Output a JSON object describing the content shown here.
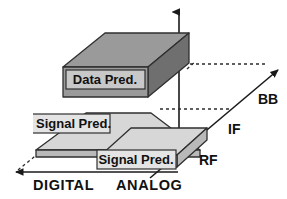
{
  "diagram": {
    "type": "3d-layered-block-diagram",
    "colors": {
      "top_face_dark": "#9a9a9a",
      "side_face_dark": "#6f6f6f",
      "top_face_light": "#d7d7d7",
      "side_face_light": "#b9b9b9",
      "label_box_fill": "#c8c8c8",
      "label_box_fill_light": "#e4e4e4",
      "outline": "#2f2f2f",
      "axis": "#1a1a1a",
      "background": "#ffffff"
    },
    "slabs": [
      {
        "id": "top",
        "label": "Data Pred.",
        "level": "BB",
        "clipped": false
      },
      {
        "id": "middle",
        "label": "Signal Pred.",
        "level": "IF",
        "clipped": true
      },
      {
        "id": "bottom",
        "label": "Signal Pred.",
        "level": "RF",
        "clipped": false
      }
    ],
    "axes": {
      "vertical": {
        "name": "vertical-axis",
        "arrow": "up"
      },
      "horizontal": {
        "name": "horizontal-axis",
        "arrow": "left",
        "ticks": [
          "DIGITAL",
          "ANALOG"
        ]
      },
      "depth": {
        "name": "depth-axis",
        "arrow": "up-right",
        "ticks": [
          "RF",
          "IF",
          "BB"
        ]
      }
    },
    "labels": {
      "digital": "DIGITAL",
      "analog": "ANALOG",
      "rf": "RF",
      "if": "IF",
      "bb": "BB",
      "data_pred": "Data Pred.",
      "signal_pred_middle": "Signal Pred.",
      "signal_pred_bottom": "Signal Pred."
    }
  }
}
